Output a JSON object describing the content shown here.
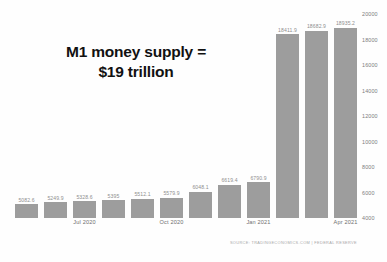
{
  "chart_data": {
    "type": "bar",
    "title": "M1 money supply = $19 trillion",
    "title_lines": [
      "M1 money supply =",
      "$19 trillion"
    ],
    "xlabel": "",
    "ylabel": "",
    "ylim": [
      4000,
      20000
    ],
    "yticks": [
      4000,
      6000,
      8000,
      10000,
      12000,
      14000,
      16000,
      18000,
      20000
    ],
    "ytick_labels": [
      "4000",
      "6000",
      "8000",
      "10000",
      "12000",
      "14000",
      "16000",
      "18000",
      "20000"
    ],
    "grid": false,
    "legend": "none",
    "bar_color": "#9d9d9d",
    "categories": [
      "",
      "",
      "Jul 2020",
      "",
      "",
      "Oct 2020",
      "",
      "",
      "Jan 2021",
      "",
      "",
      "Apr 2021"
    ],
    "xtick_labels": [
      "Jul 2020",
      "Oct 2020",
      "Jan 2021",
      "Apr 2021"
    ],
    "xtick_indices": [
      2,
      5,
      8,
      11
    ],
    "values": [
      5082.6,
      5249.9,
      5328.6,
      5395,
      5512.1,
      5579.9,
      6048.1,
      6619.4,
      6790.9,
      18411.9,
      18682.9,
      18935.2
    ],
    "value_labels": [
      "5082.6",
      "5249.9",
      "5328.6",
      "5395",
      "5512.1",
      "5579.9",
      "6048.1",
      "6619.4",
      "6790.9",
      "18411.9",
      "18682.9",
      "18935.2"
    ],
    "source_note": "SOURCE: TRADINGECONOMICS.COM | FEDERAL RESERVE"
  }
}
